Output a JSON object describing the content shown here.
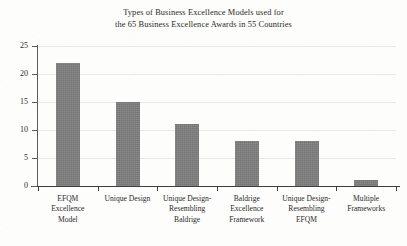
{
  "chart_data": {
    "type": "bar",
    "title": "Types of Business Excellence Models used for the 65 Business Excellence Awards in 55 Countries",
    "title_lines": [
      "Types of Business Excellence Models used for",
      "the 65 Business Excellence Awards in 55 Countries"
    ],
    "categories": [
      "EFQM Excellence Model",
      "Unique Design",
      "Unique Design-Resembling Baldrige",
      "Baldrige Excellence Framework",
      "Unique Design-Resembling EFQM",
      "Multiple Frameworks"
    ],
    "category_lines": [
      [
        "EFQM",
        "Excellence",
        "Model"
      ],
      [
        "Unique Design"
      ],
      [
        "Unique Design-",
        "Resembling",
        "Baldrige"
      ],
      [
        "Baldrige",
        "Excellence",
        "Framework"
      ],
      [
        "Unique Design-",
        "Resembling",
        "EFQM"
      ],
      [
        "Multiple",
        "Frameworks"
      ]
    ],
    "values": [
      22,
      15,
      11,
      8,
      8,
      1
    ],
    "xlabel": "",
    "ylabel": "",
    "ylim": [
      0,
      25
    ],
    "yticks": [
      0,
      5,
      10,
      15,
      20,
      25
    ],
    "ytick_labels": [
      "0",
      "5",
      "10",
      "15",
      "20",
      "25"
    ],
    "grid": true,
    "grid_axis": "y",
    "legend": false,
    "bar_color": "#7e7e7e",
    "grid_color": "#e9e9e9",
    "axis_color": "#3d3d42",
    "text_color": "#2a2a2a",
    "background_color": "#fdfdfc"
  }
}
